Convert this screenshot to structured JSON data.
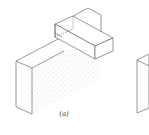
{
  "figure": {
    "caption": "(a)",
    "line_color": "#555555",
    "stipple_color": "#8a8a8a"
  }
}
